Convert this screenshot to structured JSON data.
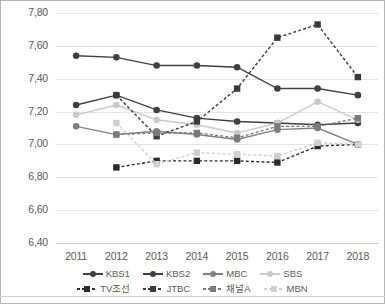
{
  "chart_data": {
    "type": "line",
    "title": "",
    "xlabel": "",
    "ylabel": "",
    "x": [
      "2011",
      "2012",
      "2013",
      "2014",
      "2015",
      "2016",
      "2017",
      "2018"
    ],
    "categories": [
      "2011",
      "2012",
      "2013",
      "2014",
      "2015",
      "2016",
      "2017",
      "2018"
    ],
    "ylim": [
      6.4,
      7.8
    ],
    "ytick_values": [
      "7,80",
      "7,60",
      "7,40",
      "7,20",
      "7,00",
      "6,80",
      "6,60",
      "6,40"
    ],
    "ytick_step": 0.2,
    "grid": true,
    "legend_position": "bottom",
    "decimal_separator": ",",
    "series": [
      {
        "name": "KBS1",
        "color": "#404040",
        "style": "solid",
        "marker": "circle",
        "values": [
          7.54,
          7.53,
          7.48,
          7.48,
          7.47,
          7.34,
          7.34,
          7.3
        ]
      },
      {
        "name": "KBS2",
        "color": "#3f3f3f",
        "style": "solid",
        "marker": "circle",
        "values": [
          7.24,
          7.3,
          7.21,
          7.16,
          7.14,
          7.13,
          7.12,
          7.13
        ]
      },
      {
        "name": "MBC",
        "color": "#808080",
        "style": "solid",
        "marker": "circle",
        "values": [
          7.11,
          7.06,
          7.08,
          7.06,
          7.03,
          7.09,
          7.1,
          7.0
        ]
      },
      {
        "name": "SBS",
        "color": "#c9c9c9",
        "style": "solid",
        "marker": "circle",
        "values": [
          7.18,
          7.24,
          7.15,
          7.12,
          7.07,
          7.13,
          7.26,
          7.15
        ]
      },
      {
        "name": "TV조선",
        "color": "#2b2b2b",
        "style": "dashed",
        "marker": "square",
        "values": [
          null,
          6.86,
          6.9,
          6.9,
          6.9,
          6.89,
          6.99,
          7.0
        ]
      },
      {
        "name": "JTBC",
        "color": "#3a3a3a",
        "style": "dashed",
        "marker": "square",
        "values": [
          null,
          7.3,
          7.05,
          7.14,
          7.34,
          7.65,
          7.73,
          7.41
        ]
      },
      {
        "name": "채널A",
        "color": "#7a7a7a",
        "style": "dashed",
        "marker": "square",
        "values": [
          null,
          7.06,
          7.07,
          7.07,
          7.04,
          7.11,
          7.11,
          7.16
        ]
      },
      {
        "name": "MBN",
        "color": "#d0d0d0",
        "style": "dashed",
        "marker": "square",
        "values": [
          null,
          7.13,
          6.88,
          6.95,
          6.94,
          6.93,
          7.01,
          7.0
        ]
      }
    ]
  },
  "legend": {
    "row1": [
      "KBS1",
      "KBS2",
      "MBC",
      "SBS"
    ],
    "row2": [
      "TV조선",
      "JTBC",
      "채널A",
      "MBN"
    ]
  }
}
